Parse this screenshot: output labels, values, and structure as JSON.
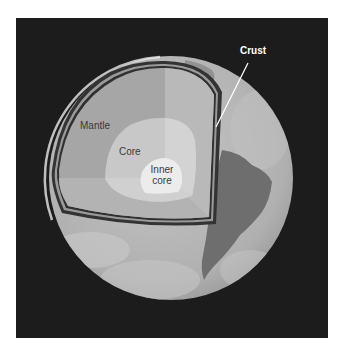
{
  "figure": {
    "colors": {
      "background": "#1c1c1c",
      "globe_surface": "#b8b8b8",
      "continent": "#6e6e6e",
      "mantle": "#a9a9a9",
      "mantle_light": "#bdbdbd",
      "core": "#cfcfcf",
      "inner_core": "#ececec",
      "crust_outline": "#333333"
    }
  },
  "labels": {
    "crust": "Crust",
    "mantle": "Mantle",
    "core": "Core",
    "inner_core_line1": "Inner",
    "inner_core_line2": "core"
  }
}
